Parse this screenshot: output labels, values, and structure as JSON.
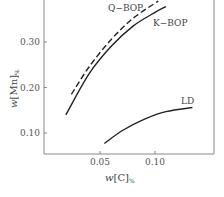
{
  "chart_data": {
    "type": "line",
    "title": "",
    "xlabel": "w[C]%",
    "ylabel": "w[Mn]%",
    "xlim": [
      0.0,
      0.155
    ],
    "ylim": [
      0.054,
      0.39
    ],
    "x_ticks": [
      0.05,
      0.1
    ],
    "x_tick_labels": [
      "0.05",
      "0.10"
    ],
    "y_ticks": [
      0.1,
      0.2,
      0.3
    ],
    "y_tick_labels": [
      "0.10",
      "0.20",
      "0.30"
    ],
    "grid": false,
    "legend": "inline labels",
    "series": [
      {
        "name": "Q-BOP",
        "style": "dashed",
        "x": [
          0.024,
          0.04,
          0.06,
          0.08,
          0.103
        ],
        "y": [
          0.185,
          0.245,
          0.305,
          0.352,
          0.39
        ]
      },
      {
        "name": "K-BOP",
        "style": "solid",
        "x": [
          0.019,
          0.04,
          0.06,
          0.08,
          0.1,
          0.11
        ],
        "y": [
          0.14,
          0.23,
          0.29,
          0.335,
          0.365,
          0.378
        ]
      },
      {
        "name": "LD",
        "style": "solid",
        "x": [
          0.054,
          0.07,
          0.09,
          0.11,
          0.134
        ],
        "y": [
          0.077,
          0.105,
          0.13,
          0.147,
          0.156
        ]
      }
    ]
  },
  "labels": {
    "xlabel_main": "w",
    "xlabel_bracket": "[C]",
    "xlabel_sub": "%",
    "ylabel_main": "w",
    "ylabel_bracket": "[Mn]",
    "ylabel_sub": "%",
    "qbop": "Q−BOP",
    "kbop": "K−BOP",
    "ld": "LD"
  }
}
